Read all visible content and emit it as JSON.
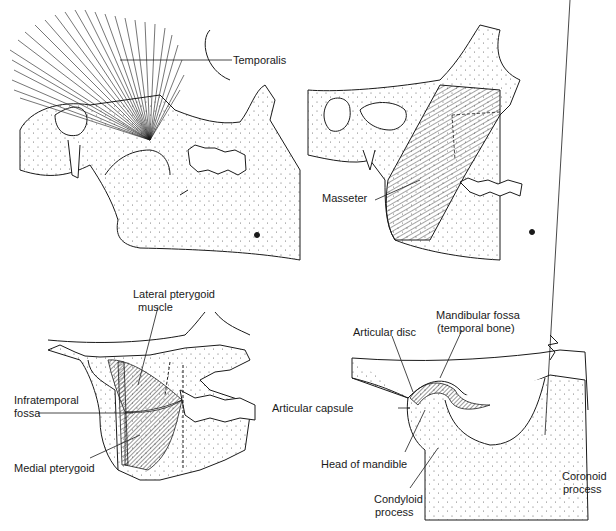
{
  "figure": {
    "panels": [
      {
        "id": "temporalis-panel",
        "labels": [
          "Temporalis"
        ]
      },
      {
        "id": "masseter-panel",
        "labels": [
          "Masseter"
        ]
      },
      {
        "id": "pterygoid-panel",
        "labels": [
          "Lateral pterygoid",
          "muscle",
          "Infratemporal",
          "fossa",
          "Medial pterygoid"
        ]
      },
      {
        "id": "tmj-panel",
        "labels": [
          "Mandibular fossa",
          "(temporal bone)",
          "Articular disc",
          "Articular capsule",
          "Head of mandible",
          "Condyloid",
          "process",
          "Coronoid",
          "process"
        ]
      }
    ]
  },
  "labels": {
    "temporalis": "Temporalis",
    "masseter": "Masseter",
    "lateral_pterygoid_1": "Lateral pterygoid",
    "lateral_pterygoid_2": "muscle",
    "infratemporal_1": "Infratemporal",
    "infratemporal_2": "fossa",
    "medial_pterygoid": "Medial pterygoid",
    "mandibular_fossa_1": "Mandibular fossa",
    "mandibular_fossa_2": "(temporal bone)",
    "articular_disc": "Articular disc",
    "articular_capsule": "Articular capsule",
    "head_of_mandible": "Head of mandible",
    "condyloid_1": "Condyloid",
    "condyloid_2": "process",
    "coronoid_1": "Coronoid",
    "coronoid_2": "process"
  },
  "colors": {
    "ink": "#1a1a1a",
    "paper": "#ffffff",
    "stipple": "#555555"
  }
}
